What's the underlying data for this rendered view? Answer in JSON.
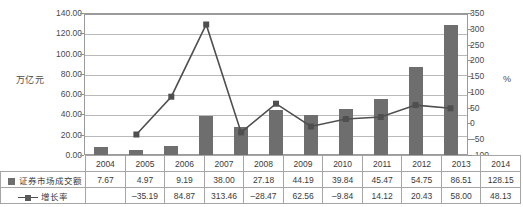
{
  "chart_data": {
    "type": "bar",
    "title": "",
    "subtitle": "",
    "xlabel": "",
    "ylabel": "万亿元",
    "ylabel_right": "%",
    "categories": [
      "2004",
      "2005",
      "2006",
      "2007",
      "2008",
      "2009",
      "2010",
      "2011",
      "2012",
      "2013",
      "2014"
    ],
    "grid": true,
    "legend_position": "table-left",
    "ylim": [
      0,
      140
    ],
    "ylim_right": [
      -100,
      350
    ],
    "yticks": [
      "0.00",
      "20.00",
      "40.00",
      "60.00",
      "80.00",
      "100.00",
      "120.00",
      "140.00"
    ],
    "yticks_right": [
      "-100",
      "-50",
      "0",
      "50",
      "100",
      "150",
      "200",
      "250",
      "300",
      "350"
    ],
    "series": [
      {
        "name": "证券市场成交额",
        "type": "bar",
        "axis": "left",
        "color": "#6e6e6e",
        "values": [
          7.67,
          4.97,
          9.19,
          38.0,
          27.18,
          44.19,
          39.84,
          45.47,
          54.75,
          86.51,
          128.15
        ],
        "labels": [
          "7.67",
          "4.97",
          "9.19",
          "38.00",
          "27.18",
          "44.19",
          "39.84",
          "45.47",
          "54.75",
          "86.51",
          "128.15"
        ]
      },
      {
        "name": "增长率",
        "type": "line",
        "axis": "right",
        "color": "#4f4f4f",
        "values": [
          null,
          -35.19,
          84.87,
          313.46,
          -28.47,
          62.56,
          -9.84,
          14.12,
          20.43,
          58.0,
          48.13
        ],
        "labels": [
          "",
          "-35.19",
          "84.87",
          "313.46",
          "-28.47",
          "62.56",
          "-9.84",
          "14.12",
          "20.43",
          "58.00",
          "48.13"
        ]
      }
    ]
  },
  "axis": {
    "left_title": "万亿元",
    "right_title": "%",
    "left_ticks": [
      "140.00",
      "120.00",
      "100.00",
      "80.00",
      "60.00",
      "40.00",
      "20.00",
      "0.00"
    ],
    "right_ticks": [
      "350",
      "300",
      "250",
      "200",
      "150",
      "100",
      "50",
      "0",
      "-50",
      "-100"
    ]
  },
  "table": {
    "year_header": [
      "2004",
      "2005",
      "2006",
      "2007",
      "2008",
      "2009",
      "2010",
      "2011",
      "2012",
      "2013",
      "2014"
    ],
    "rows": [
      {
        "label": "证券市场成交额",
        "marker": "square-swatch",
        "values": [
          "7.67",
          "4.97",
          "9.19",
          "38.00",
          "27.18",
          "44.19",
          "39.84",
          "45.47",
          "54.75",
          "86.51",
          "128.15"
        ]
      },
      {
        "label": "增长率",
        "marker": "line-marker",
        "values": [
          "",
          "-35.19",
          "84.87",
          "313.46",
          "-28.47",
          "62.56",
          "-9.84",
          "14.12",
          "20.43",
          "58.00",
          "48.13"
        ]
      }
    ]
  },
  "colors": {
    "bar": "#6e6e6e",
    "line": "#4f4f4f",
    "grid": "#b9b9b9",
    "frame": "#9a9a9a",
    "text": "#3a3a3a"
  }
}
